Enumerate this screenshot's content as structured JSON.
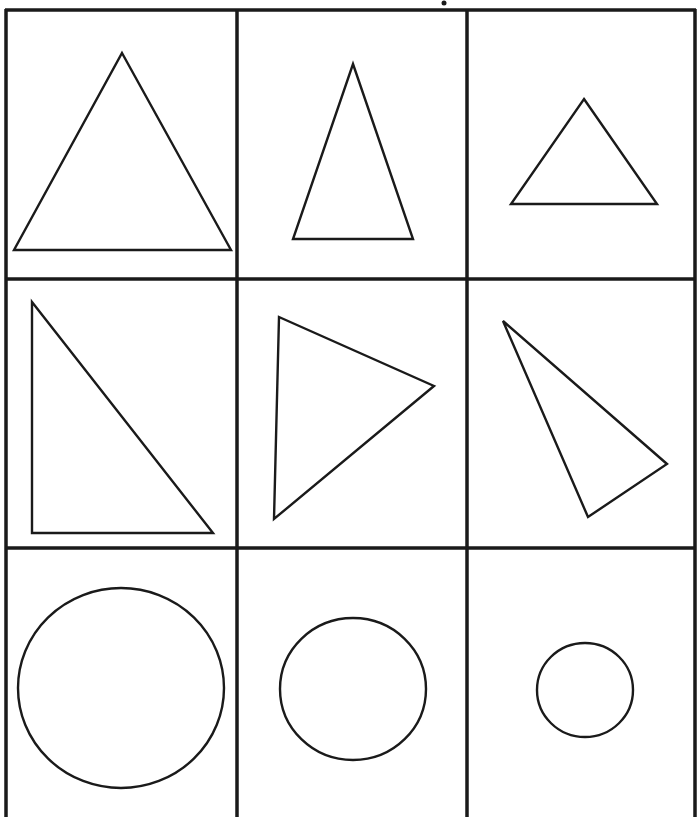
{
  "worksheet": {
    "type": "shape-grid",
    "rows": 3,
    "columns": 3,
    "colors": {
      "line": "#1a1a1a",
      "background": "#ffffff"
    },
    "grid": {
      "outer_left_x": 6,
      "outer_right_x": 695,
      "top_y": 10,
      "column_dividers_x": [
        237,
        467
      ],
      "row_dividers_y": [
        279,
        548
      ],
      "bottom_cut_off": true
    },
    "top_mark": {
      "x": 444,
      "y": 3,
      "description": "small dot (cropped character)"
    },
    "cells": [
      {
        "row": 1,
        "col": 1,
        "shape": "triangle",
        "kind": "equilateral-large",
        "points": "122,53 231,250 14,250"
      },
      {
        "row": 1,
        "col": 2,
        "shape": "triangle",
        "kind": "isosceles-tall",
        "points": "353,64 413,239 293,239"
      },
      {
        "row": 1,
        "col": 3,
        "shape": "triangle",
        "kind": "equilateral-small",
        "points": "584,99 657,204 511,204"
      },
      {
        "row": 2,
        "col": 1,
        "shape": "triangle",
        "kind": "right-triangle",
        "points": "32,302 213,533 32,533"
      },
      {
        "row": 2,
        "col": 2,
        "shape": "triangle",
        "kind": "rotated-pointing-right",
        "points": "279,317 434,386 274,519"
      },
      {
        "row": 2,
        "col": 3,
        "shape": "triangle",
        "kind": "rotated-scalene",
        "points": "503,321 667,464 588,517"
      },
      {
        "row": 3,
        "col": 1,
        "shape": "circle",
        "kind": "large",
        "cx": 121,
        "cy": 688,
        "rx": 103,
        "ry": 100
      },
      {
        "row": 3,
        "col": 2,
        "shape": "circle",
        "kind": "medium",
        "cx": 353,
        "cy": 689,
        "rx": 73,
        "ry": 71
      },
      {
        "row": 3,
        "col": 3,
        "shape": "circle",
        "kind": "small",
        "cx": 585,
        "cy": 690,
        "rx": 48,
        "ry": 47
      }
    ]
  }
}
